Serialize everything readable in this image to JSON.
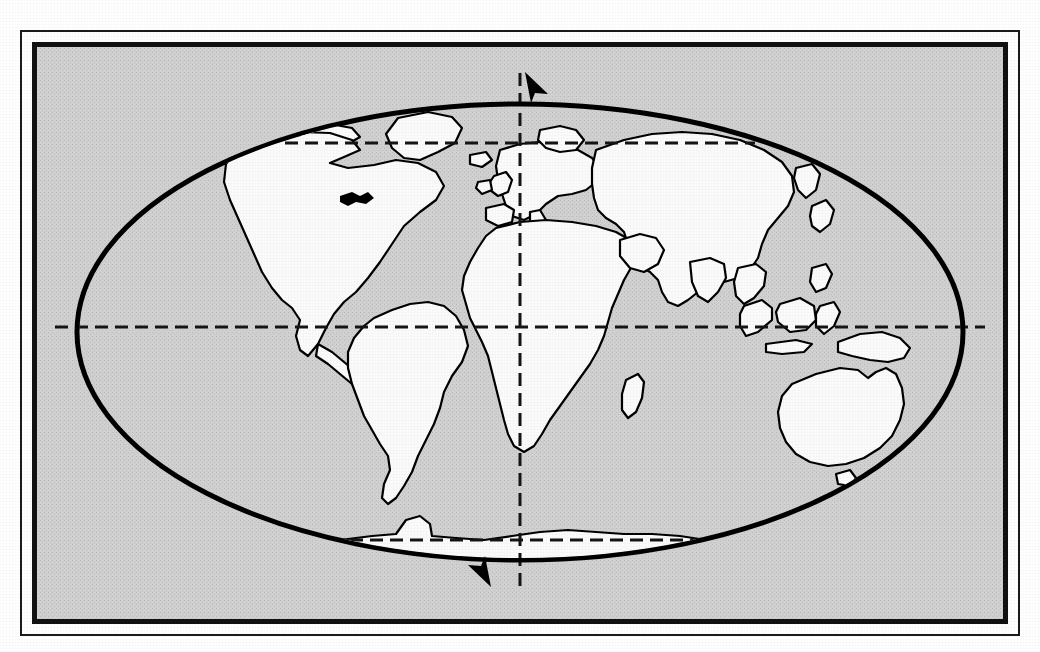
{
  "figure": {
    "kind": "world-map",
    "projection": "elliptical (Mollweide-like) whole-world projection",
    "caption": "",
    "background_color": "#ffffff"
  },
  "frame": {
    "outer_rect": {
      "x": 21,
      "y": 31,
      "width": 998,
      "height": 604,
      "stroke": "#1a1a1a",
      "stroke_width": 2
    },
    "inner_rect": {
      "x": 34,
      "y": 44,
      "width": 972,
      "height": 578,
      "stroke": "#111111",
      "stroke_width": 5
    },
    "gap_color": "#ffffff",
    "fill_color": "#cfcfcf"
  },
  "ellipse": {
    "label": "world-outline",
    "cx": 520,
    "cy": 332,
    "rx": 443,
    "ry": 228,
    "stroke": "#000000",
    "stroke_width": 5,
    "fill": "#cfcfcf"
  },
  "land": {
    "fill": "#fbfbfb",
    "stroke": "#000000",
    "stroke_width": 2.2,
    "regions": [
      "north-america",
      "greenland",
      "south-america",
      "europe",
      "great-britain",
      "africa",
      "madagascar",
      "asia",
      "japan",
      "indonesia",
      "new-guinea",
      "australia",
      "tasmania",
      "new-zealand",
      "antarctica"
    ]
  },
  "graticule": {
    "stroke": "#141414",
    "stroke_width": 3,
    "dash": "13 7",
    "lines": [
      {
        "name": "equator",
        "kind": "parallel",
        "latitude_label": "0°",
        "x1": 55,
        "y1": 327,
        "x2": 985,
        "y2": 327
      },
      {
        "name": "prime-meridian",
        "kind": "meridian",
        "longitude_label": "0°",
        "x1": 520,
        "y1": 73,
        "x2": 520,
        "y2": 588
      },
      {
        "name": "arctic-circle",
        "kind": "parallel",
        "latitude_label": "",
        "x1": 285,
        "y1": 143,
        "x2": 755,
        "y2": 143
      },
      {
        "name": "antarctic-circle",
        "kind": "parallel",
        "latitude_label": "",
        "x1": 350,
        "y1": 540,
        "x2": 715,
        "y2": 540
      }
    ]
  },
  "arrows": [
    {
      "name": "north-pole-arrow",
      "direction": "up",
      "tip_x": 525,
      "tip_y": 72,
      "fill": "#000000"
    },
    {
      "name": "south-pole-arrow",
      "direction": "down",
      "tip_x": 491,
      "tip_y": 587,
      "fill": "#000000"
    }
  ]
}
